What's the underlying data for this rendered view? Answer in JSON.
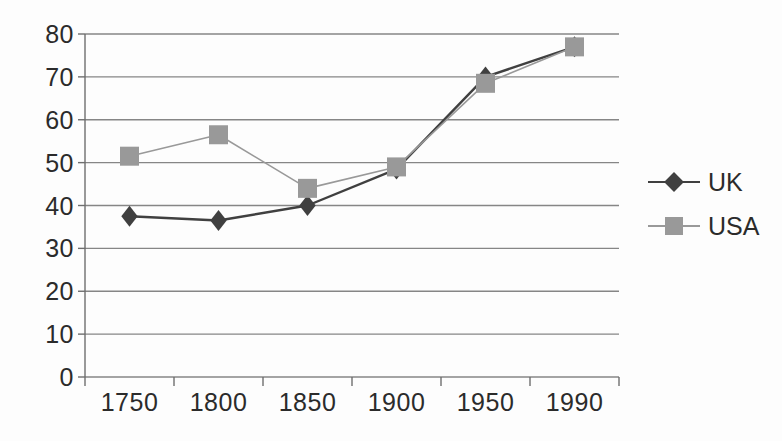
{
  "chart_data": {
    "type": "line",
    "title": "",
    "subtitle": "",
    "xlabel": "",
    "ylabel": "",
    "categories": [
      "1750",
      "1800",
      "1850",
      "1900",
      "1950",
      "1990"
    ],
    "series": [
      {
        "name": "UK",
        "values": [
          37.5,
          36.5,
          40,
          48.5,
          70,
          77
        ],
        "color": "#404040",
        "marker": "diamond"
      },
      {
        "name": "USA",
        "values": [
          51.5,
          56.5,
          44,
          49,
          68.5,
          77
        ],
        "color": "#999999",
        "marker": "square"
      }
    ],
    "ylim": [
      0,
      80
    ],
    "ytick_step": 10,
    "yticks": [
      "0",
      "10",
      "20",
      "30",
      "40",
      "50",
      "60",
      "70",
      "80"
    ],
    "grid": "horizontal",
    "legend_position": "right"
  },
  "legend": {
    "entries": [
      {
        "label": "UK"
      },
      {
        "label": "USA"
      }
    ]
  },
  "colors": {
    "uk": "#404040",
    "usa": "#999999",
    "gridline": "#868686",
    "axis": "#6e6e6e",
    "text": "#2b2b2b",
    "background": "#fdfdfd"
  }
}
